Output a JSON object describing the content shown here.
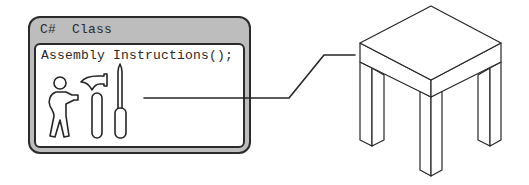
{
  "diagram": {
    "class_box": {
      "language_label": "C#",
      "kind_label": "Class",
      "method": "Assembly Instructions();",
      "icons": [
        "person-icon",
        "hammer-icon",
        "screwdriver-icon"
      ]
    },
    "connector": {
      "from": "class-box",
      "to": "table"
    },
    "object": {
      "name": "table",
      "depiction": "isometric-table-icon"
    },
    "colors": {
      "stroke": "#262626",
      "header_fill": "#bdbdbd",
      "body_fill": "#ffffff"
    }
  }
}
